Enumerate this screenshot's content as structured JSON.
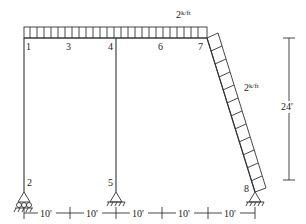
{
  "load": {
    "top_label": "2",
    "top_unit": "k/ft",
    "incl_label": "2",
    "incl_unit": "k/ft"
  },
  "nodes": [
    "1",
    "2",
    "3",
    "4",
    "5",
    "6",
    "7",
    "8"
  ],
  "dims": {
    "height": "24'",
    "spans": [
      "10'",
      "10'",
      "10'",
      "10'",
      "10'"
    ]
  },
  "colors": {
    "line": "#222222",
    "bg": "#ffffff"
  }
}
